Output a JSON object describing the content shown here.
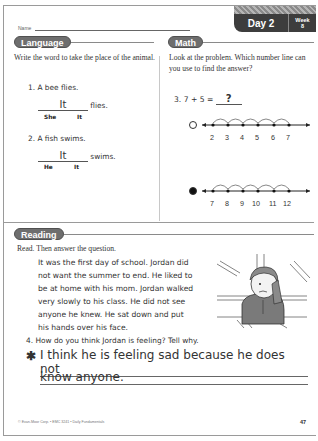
{
  "header": {
    "name_label": "Name",
    "day_label": "Day 2",
    "week_label": "Week",
    "week_number": "8"
  },
  "language": {
    "title": "Language",
    "instructions": "Write the word to take the place of the animal.",
    "items": [
      {
        "number": "1.",
        "sentence": "A bee flies.",
        "answer": "It",
        "ending": "flies.",
        "choices": [
          "She",
          "It"
        ]
      },
      {
        "number": "2.",
        "sentence": "A fish swims.",
        "answer": "It",
        "ending": "swims.",
        "choices": [
          "He",
          "It"
        ]
      }
    ]
  },
  "math": {
    "title": "Math",
    "instructions": "Look at the problem. Which number line can you use to find the answer?",
    "problem_number": "3.",
    "equation": "7 + 5 =",
    "answer": "?",
    "number_lines": [
      {
        "selected": false,
        "labels": [
          "2",
          "3",
          "4",
          "5",
          "6",
          "7"
        ]
      },
      {
        "selected": true,
        "labels": [
          "7",
          "8",
          "9",
          "10",
          "11",
          "12"
        ]
      }
    ]
  },
  "reading": {
    "title": "Reading",
    "instructions": "Read. Then answer the question.",
    "story_lines": [
      "It was the first day of school. Jordan did",
      "not want the summer to end. He liked to",
      "be at home with his mom. Jordan walked",
      "very slowly to his class. He did not see",
      "anyone he knew. He sat down and put",
      "his hands over his face."
    ],
    "illustration": "sad-boy-at-desk",
    "question_number": "4.",
    "question": "How do you think Jordan is feeling? Tell why.",
    "answer_marker": "✱",
    "answer_lines": [
      "I think he is feeling sad because he does not",
      "know anyone."
    ]
  },
  "footer": {
    "copyright": "© Evan-Moor Corp. • EMC 3241 • Daily Fundamentals",
    "page_number": "47"
  }
}
